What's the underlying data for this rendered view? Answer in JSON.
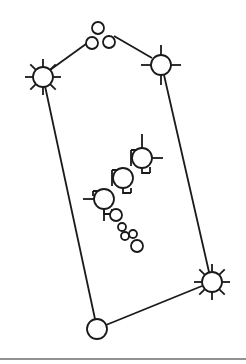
{
  "diagram": {
    "title": "",
    "stroke_color": "#1a1a1a",
    "rule_color": "#6e6e6e",
    "edges": [
      {
        "from": "n_left_sun",
        "to": "n_top_c2",
        "x1": 50,
        "y1": 70,
        "x2": 86,
        "y2": 44
      },
      {
        "from": "n_top_c3",
        "to": "n_right_top",
        "x1": 114,
        "y1": 36,
        "x2": 152,
        "y2": 58
      },
      {
        "from": "n_left_sun",
        "to": "n_bottom_left",
        "x1": 45,
        "y1": 86,
        "x2": 95,
        "y2": 319
      },
      {
        "from": "n_right_top",
        "to": "n_bottom_right",
        "x1": 164,
        "y1": 75,
        "x2": 209,
        "y2": 272
      },
      {
        "from": "n_bottom_left",
        "to": "n_bottom_right",
        "x1": 106,
        "y1": 325,
        "x2": 202,
        "y2": 286
      }
    ],
    "nodes": [
      {
        "id": "n_top_c1",
        "type": "circle",
        "cx": 98,
        "cy": 28,
        "r": 6
      },
      {
        "id": "n_top_c2",
        "type": "circle",
        "cx": 92,
        "cy": 43,
        "r": 6
      },
      {
        "id": "n_top_c3",
        "type": "circle",
        "cx": 109,
        "cy": 42,
        "r": 6
      },
      {
        "id": "n_left_sun",
        "type": "sun",
        "cx": 43,
        "cy": 77,
        "r": 10,
        "rays": 8
      },
      {
        "id": "n_right_top",
        "type": "cross",
        "cx": 161,
        "cy": 65,
        "r": 10,
        "rays": 4
      },
      {
        "id": "n_bottom_right",
        "type": "sun",
        "cx": 212,
        "cy": 282,
        "r": 10,
        "rays": 8
      },
      {
        "id": "n_bottom_left",
        "type": "circle",
        "cx": 97,
        "cy": 329,
        "r": 10
      },
      {
        "id": "n_chain_1",
        "type": "chain",
        "cx": 142,
        "cy": 158,
        "r": 10
      },
      {
        "id": "n_chain_2",
        "type": "chain",
        "cx": 123,
        "cy": 178,
        "r": 10
      },
      {
        "id": "n_chain_3",
        "type": "chain",
        "cx": 104,
        "cy": 199,
        "r": 10
      },
      {
        "id": "n_small_1",
        "type": "circle",
        "cx": 116,
        "cy": 215,
        "r": 6
      },
      {
        "id": "n_small_2",
        "type": "circle",
        "cx": 122,
        "cy": 227,
        "r": 4
      },
      {
        "id": "n_small_3",
        "type": "circle",
        "cx": 125,
        "cy": 236,
        "r": 4
      },
      {
        "id": "n_small_4",
        "type": "circle",
        "cx": 133,
        "cy": 234,
        "r": 4
      },
      {
        "id": "n_small_5",
        "type": "circle",
        "cx": 137,
        "cy": 246,
        "r": 6
      }
    ],
    "rule": {
      "x1": 0,
      "y1": 359,
      "x2": 246,
      "y2": 359
    }
  }
}
